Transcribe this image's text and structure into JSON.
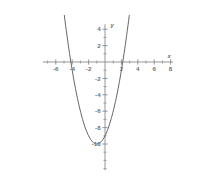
{
  "figure": {
    "background_color": "#ffffff",
    "axis_color": "#8a8a8a",
    "curve_color": "#555555",
    "label_color": "#6f6f6f"
  },
  "chart_data": {
    "type": "line",
    "title": "",
    "subtitle": "",
    "xlabel": "x",
    "ylabel": "y",
    "grid": false,
    "legend": null,
    "xlim": [
      -7.6,
      8.3
    ],
    "ylim": [
      -13.2,
      4.6
    ],
    "x_ticks": [
      -6,
      -4,
      -2,
      2,
      4,
      6,
      8
    ],
    "x_tick_labels": [
      "-6",
      "-4",
      "-2",
      "2",
      "4",
      "6",
      "8"
    ],
    "x_minor_tick_step": 1,
    "y_ticks": [
      4,
      2,
      -2,
      -4,
      -6,
      -8,
      -10
    ],
    "y_tick_labels": [
      "4",
      "2",
      "-2",
      "-4",
      "-6",
      "-8",
      "-10"
    ],
    "y_minor_tick_step": 1,
    "origin_label": "",
    "series": [
      {
        "name": "parabola",
        "equation": "y = x^2 + 2x - 9",
        "vertex": [
          -1,
          -10
        ],
        "roots": [
          -4.16,
          2.16
        ],
        "y_intercept": -9,
        "x": [
          -4.8,
          -4.6,
          -4.4,
          -4.2,
          -4.0,
          -3.8,
          -3.6,
          -3.4,
          -3.2,
          -3.0,
          -2.8,
          -2.6,
          -2.4,
          -2.2,
          -2.0,
          -1.8,
          -1.6,
          -1.4,
          -1.2,
          -1.0,
          -0.8,
          -0.6,
          -0.4,
          -0.2,
          0.0,
          0.2,
          0.4,
          0.6,
          0.8,
          1.0,
          1.2,
          1.4,
          1.6,
          1.8,
          2.0,
          2.2,
          2.4,
          2.6,
          2.8,
          3.0
        ],
        "y": [
          3.64,
          2.96,
          2.56,
          2.04,
          1.56,
          1.04,
          0.56,
          0.04,
          -0.44,
          -0.96,
          -1.44,
          -1.96,
          -2.44,
          -2.96,
          -3.44,
          -3.96,
          -4.44,
          -4.96,
          -5.44,
          -5.96,
          -6.44,
          -6.96,
          -7.44,
          -7.96,
          -8.44,
          -8.96,
          -9.44,
          -9.96,
          -10.44,
          -10.96,
          -11.44,
          -11.96,
          -12.44,
          -12.96,
          -13.44,
          -13.96,
          -14.44,
          -14.96,
          -15.44,
          -15.96
        ]
      }
    ]
  }
}
